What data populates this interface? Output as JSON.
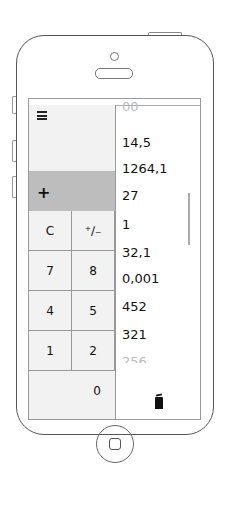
{
  "calculator": {
    "operator": "+",
    "keys": [
      {
        "label": "C"
      },
      {
        "label": "⁺∕₋"
      },
      {
        "label": "7"
      },
      {
        "label": "8"
      },
      {
        "label": "4"
      },
      {
        "label": "5"
      },
      {
        "label": "1"
      },
      {
        "label": "2"
      },
      {
        "label": "0"
      }
    ]
  },
  "history": {
    "items": [
      "14,5",
      "1264,1",
      "27",
      "1",
      "32,1",
      "0,001",
      "452",
      "321",
      "256"
    ],
    "top_partial": "00"
  },
  "icons": {
    "menu": "hamburger-icon",
    "delete": "trash-icon"
  }
}
